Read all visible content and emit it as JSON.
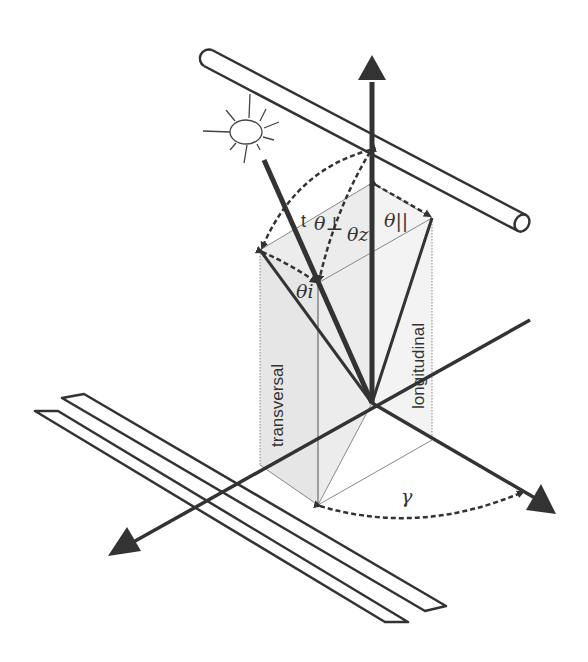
{
  "diagram": {
    "colors": {
      "background": "#ffffff",
      "stroke": "#333333",
      "thin_stroke": "#777777",
      "plane_fill": "#e8e8e8"
    },
    "labels": {
      "theta_perp": "θ⊥",
      "theta_perp_prefix": "t",
      "theta_z": "θz",
      "theta_par": "θ||",
      "theta_i": "θi",
      "gamma": "γ",
      "transversal": "transversal",
      "longitudinal": "longitudinal"
    },
    "elements": [
      {
        "name": "sun",
        "type": "icon"
      },
      {
        "name": "sun-ray",
        "type": "vector"
      },
      {
        "name": "zenith-axis",
        "type": "arrow"
      },
      {
        "name": "pipe",
        "type": "cylinder"
      },
      {
        "name": "rails",
        "type": "track"
      },
      {
        "name": "transversal-plane",
        "type": "plane"
      },
      {
        "name": "longitudinal-plane",
        "type": "plane"
      },
      {
        "name": "azimuth-arc",
        "type": "dashed-arc"
      }
    ]
  }
}
